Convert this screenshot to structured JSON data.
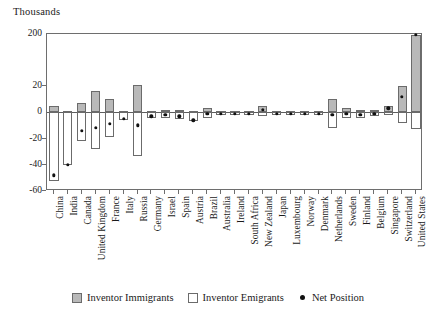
{
  "figure": {
    "unit_caption": "Thousands"
  },
  "legend": {
    "items": [
      {
        "label": "Inventor Immigrants",
        "style": "filled",
        "color": "#b9b9b9",
        "name": "inventor-immigrants"
      },
      {
        "label": "Inventor Emigrants",
        "style": "hollow",
        "color": "#ffffff",
        "name": "inventor-emigrants"
      },
      {
        "label": "Net Position",
        "style": "dot",
        "color": "#111111",
        "name": "net-position"
      }
    ]
  },
  "chart_data": {
    "type": "bar",
    "title": "",
    "subtitle": "",
    "xlabel": "",
    "ylabel": "Thousands",
    "ylim": [
      -60,
      200
    ],
    "grid": false,
    "legend_position": "bottom",
    "axis_break": true,
    "y_ticks": [
      200,
      20,
      0,
      -20,
      -40,
      -60
    ],
    "y_tick_labels": [
      "200",
      "20",
      "0",
      "-20",
      "-40",
      "-60"
    ],
    "categories": [
      "China",
      "India",
      "Canada",
      "United Kingdom",
      "France",
      "Italy",
      "Russia",
      "Germany",
      "Israel",
      "Spain",
      "Austria",
      "Brazil",
      "Australia",
      "Ireland",
      "South Africa",
      "New Zealand",
      "Japan",
      "Luxembourg",
      "Norway",
      "Denmark",
      "Netherlands",
      "Sweden",
      "Finland",
      "Belgium",
      "Singapore",
      "Switzerland",
      "United States"
    ],
    "series": [
      {
        "name": "Inventor Immigrants",
        "values": [
          5,
          1,
          7,
          16,
          10,
          1,
          23,
          1,
          2,
          2,
          1,
          3,
          1,
          1,
          1,
          5,
          1,
          1,
          1,
          1,
          10,
          3,
          2,
          2,
          5,
          20,
          197
        ]
      },
      {
        "name": "Inventor Emigrants",
        "values": [
          -52,
          -40,
          -22,
          -28,
          -19,
          -6,
          -33,
          -4,
          -4,
          -5,
          -7,
          -4,
          -2,
          -2,
          -2,
          -3,
          -2,
          -2,
          -2,
          -2,
          -12,
          -4,
          -4,
          -3,
          -2,
          -8,
          -13
        ]
      },
      {
        "name": "Net Position",
        "values": [
          -48,
          -40,
          -14,
          -12,
          -9,
          -5,
          -10,
          -3,
          -2,
          -3,
          -6,
          -1,
          -1,
          -1,
          -1,
          2,
          -1,
          -1,
          -1,
          -1,
          -2,
          -1,
          -2,
          -1,
          3,
          12,
          197
        ]
      }
    ]
  }
}
